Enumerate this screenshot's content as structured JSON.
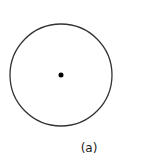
{
  "figure": {
    "caption": "(a)",
    "circle": {
      "cx": 61,
      "cy": 75,
      "r": 51,
      "stroke": "#333333",
      "stroke_width": 1.3,
      "fill": "none"
    },
    "center_point": {
      "cx": 61,
      "cy": 75,
      "r": 2.5,
      "fill": "#000000"
    }
  }
}
